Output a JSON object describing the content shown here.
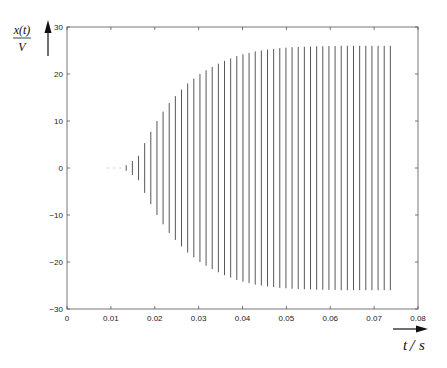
{
  "chart_data": {
    "type": "line",
    "title": "",
    "xlabel": "t/s",
    "ylabel": "x(t)/V",
    "ylabel_parts": {
      "numerator": "x(t)",
      "denominator": "V"
    },
    "xlabel_parts": {
      "left": "t",
      "right": "s"
    },
    "xlim": [
      0,
      0.08
    ],
    "ylim": [
      -30,
      30
    ],
    "xticks": [
      0,
      0.01,
      0.02,
      0.03,
      0.04,
      0.05,
      0.06,
      0.07,
      0.08
    ],
    "xtick_labels": [
      "0",
      "0.01",
      "0.02",
      "0.03",
      "0.04",
      "0.05",
      "0.06",
      "0.07",
      "0.08"
    ],
    "yticks": [
      -30,
      -20,
      -10,
      0,
      10,
      20,
      30
    ],
    "ytick_labels": [
      "-30",
      "-20",
      "-10",
      "0",
      "10",
      "20",
      "30"
    ],
    "grid": false,
    "legend": null,
    "series": [
      {
        "name": "x(t) envelope",
        "t": [
          0.0093,
          0.0107,
          0.0121,
          0.0135,
          0.0149,
          0.0163,
          0.0177,
          0.0191,
          0.0205,
          0.0219,
          0.0233,
          0.0247,
          0.0261,
          0.0275,
          0.0289,
          0.0303,
          0.0317,
          0.0331,
          0.0345,
          0.0359,
          0.0373,
          0.0387,
          0.0401,
          0.0415,
          0.0429,
          0.0443,
          0.0457,
          0.0471,
          0.0485,
          0.0499,
          0.0513,
          0.0527,
          0.0541,
          0.0555,
          0.0569,
          0.0583,
          0.0597,
          0.0611,
          0.0625,
          0.0639,
          0.0653,
          0.0667,
          0.0681,
          0.0695,
          0.0709,
          0.0723,
          0.0737
        ],
        "amplitude": [
          0.1,
          0.15,
          0.3,
          0.6,
          1.5,
          2.6,
          5.3,
          7.7,
          10.0,
          12.0,
          13.8,
          15.3,
          16.7,
          18.0,
          19.0,
          20.0,
          20.8,
          21.5,
          22.2,
          22.8,
          23.3,
          23.8,
          24.2,
          24.5,
          24.8,
          25.0,
          25.2,
          25.35,
          25.5,
          25.6,
          25.7,
          25.75,
          25.8,
          25.85,
          25.9,
          25.9,
          25.95,
          25.95,
          26.0,
          26.0,
          26.0,
          26.0,
          26.0,
          26.0,
          26.0,
          26.0,
          26.0
        ]
      }
    ]
  }
}
